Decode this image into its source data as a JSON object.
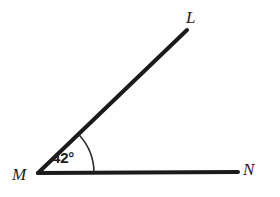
{
  "figure": {
    "type": "geometry-diagram",
    "background_color": "#ffffff",
    "stroke_color": "#1b1b1b",
    "width": 280,
    "height": 197
  },
  "labels": {
    "vertex_M": "M",
    "point_L": "L",
    "point_N": "N",
    "angle_measure": "42°"
  },
  "geometry": {
    "vertex": {
      "name": "M",
      "x": 38,
      "y": 173
    },
    "rays": [
      {
        "name": "ray-ML",
        "from": "M",
        "to": "L",
        "start": {
          "x": 38,
          "y": 173
        },
        "end": {
          "x": 187,
          "y": 30
        }
      },
      {
        "name": "ray-MN",
        "from": "M",
        "to": "N",
        "start": {
          "x": 38,
          "y": 173
        },
        "end": {
          "x": 238,
          "y": 172
        }
      }
    ],
    "arc": {
      "name": "angle-arc-LMN",
      "center": {
        "x": 38,
        "y": 173
      },
      "radius": 56,
      "start_angle_deg": 0,
      "end_angle_deg": 42,
      "path": "M 94 172 A 56 56 0 0 0 79.6 135.5"
    },
    "angle_value_degrees": 42
  }
}
